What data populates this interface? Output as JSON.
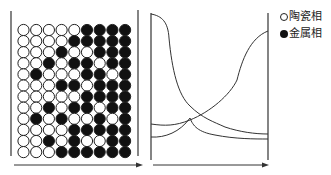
{
  "legend": {
    "items": [
      {
        "symbol": "open-circle",
        "label": "陶瓷相"
      },
      {
        "symbol": "filled-circle",
        "label": "金属相"
      }
    ]
  },
  "grid": {
    "rows": 12,
    "cols": 9,
    "pattern": [
      "OOOOO####",
      "OOOO#####",
      "OOO#OO###",
      "OO#O##O##",
      "O#OOO##O#",
      "OOO##O###",
      "OOOOO####",
      "OO#O##O##",
      "O#O#OO#O#",
      "OOOO#####",
      "OO#O#OO##",
      "OOO######"
    ]
  },
  "chart_data": {
    "type": "line",
    "title": "",
    "xlabel": "",
    "ylabel": "",
    "series": [
      {
        "name": "decreasing-curve",
        "x": [
          0,
          0.08,
          0.15,
          0.25,
          0.4,
          0.55,
          0.75,
          1.0
        ],
        "y": [
          0.95,
          0.88,
          0.6,
          0.35,
          0.2,
          0.14,
          0.11,
          0.1
        ]
      },
      {
        "name": "increasing-curve",
        "x": [
          0,
          0.15,
          0.3,
          0.45,
          0.6,
          0.75,
          0.85,
          1.0
        ],
        "y": [
          0.18,
          0.17,
          0.19,
          0.25,
          0.38,
          0.6,
          0.72,
          0.77
        ]
      },
      {
        "name": "lower-curve-left",
        "x": [
          0,
          0.2,
          0.35,
          0.45
        ],
        "y": [
          0.09,
          0.1,
          0.14,
          0.22
        ]
      },
      {
        "name": "lower-curve-right",
        "x": [
          0.45,
          0.5,
          0.65,
          1.0
        ],
        "y": [
          0.22,
          0.12,
          0.08,
          0.07
        ]
      }
    ],
    "legend": [
      "陶瓷相",
      "金属相"
    ],
    "grid": false
  }
}
